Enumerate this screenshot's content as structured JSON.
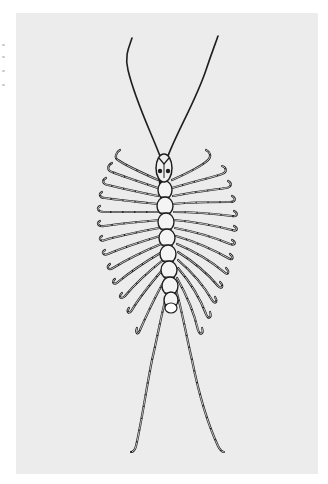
{
  "image": {
    "subject": "House centipede (Scutigera coleoptrata) line illustration",
    "background_color": "#ececec",
    "page_color": "#ffffff",
    "ink_color": "#1e1e1e",
    "segment_fill": "#f4f4f4"
  },
  "centipede": {
    "head": {
      "cx": 164,
      "cy": 168,
      "rx": 8,
      "ry": 14
    },
    "antennae": [
      {
        "side": "left",
        "path": "M160 156 C 150 130, 135 100, 128 70 C 124 55, 130 45, 132 38"
      },
      {
        "side": "right",
        "path": "M168 156 C 178 130, 196 100, 206 70 C 212 52, 216 42, 218 36"
      }
    ],
    "segments": [
      {
        "cx": 165,
        "cy": 190,
        "rx": 7,
        "ry": 9
      },
      {
        "cx": 165,
        "cy": 206,
        "rx": 8,
        "ry": 9
      },
      {
        "cx": 166,
        "cy": 222,
        "rx": 8,
        "ry": 9
      },
      {
        "cx": 167,
        "cy": 238,
        "rx": 8,
        "ry": 9
      },
      {
        "cx": 168,
        "cy": 254,
        "rx": 8,
        "ry": 9
      },
      {
        "cx": 169,
        "cy": 270,
        "rx": 8,
        "ry": 9
      },
      {
        "cx": 170,
        "cy": 286,
        "rx": 8,
        "ry": 9
      },
      {
        "cx": 171,
        "cy": 300,
        "rx": 7,
        "ry": 8
      }
    ],
    "legs_left": [
      "M158 180 C 140 172, 125 165, 118 160 C 114 158, 116 152, 120 150",
      "M158 188 C 140 182, 122 176, 112 172 C 106 170, 108 165, 112 163",
      "M158 196 C 138 192, 120 188, 108 185 C 102 184, 102 180, 106 178",
      "M158 204 C 138 202, 118 200, 105 198 C 100 198, 98 194, 102 192",
      "M158 212 C 138 212, 118 212, 104 212 C 98 212, 96 208, 100 206",
      "M159 220 C 138 222, 118 224, 104 226 C 98 227, 96 223, 100 221",
      "M159 228 C 138 232, 118 236, 105 240 C 100 242, 98 238, 102 236",
      "M160 236 C 140 242, 122 248, 108 254 C 103 256, 101 252, 105 250",
      "M161 244 C 142 252, 126 260, 113 268 C 108 271, 106 267, 110 264",
      "M162 252 C 145 262, 130 272, 118 282 C 114 286, 111 282, 115 279",
      "M163 260 C 148 272, 135 284, 125 296 C 121 300, 118 297, 122 293",
      "M164 268 C 152 282, 140 296, 132 310 C 129 315, 126 312, 129 308",
      "M166 278 C 156 294, 148 312, 140 330 C 138 336, 135 333, 137 328",
      "M168 290 C 162 310, 158 335, 152 360 C 146 390, 142 420, 136 446 C 135 450, 133 452, 131 452"
    ],
    "legs_right": [
      "M172 180 C 190 172, 202 166, 208 160 C 212 156, 210 152, 206 150",
      "M172 188 C 192 182, 210 178, 222 174 C 228 172, 226 167, 222 166",
      "M173 196 C 194 192, 212 190, 226 188 C 232 187, 232 183, 228 181",
      "M173 204 C 194 202, 214 202, 230 202 C 236 202, 236 198, 232 196",
      "M174 212 C 196 212, 216 214, 232 216 C 238 217, 238 213, 234 211",
      "M174 220 C 196 222, 216 226, 232 230 C 238 232, 238 228, 234 226",
      "M175 228 C 196 232, 216 238, 230 244 C 236 246, 236 242, 232 240",
      "M176 236 C 196 242, 214 250, 228 258 C 233 261, 234 257, 230 254",
      "M177 244 C 196 252, 212 262, 224 272 C 228 276, 230 272, 226 268",
      "M178 252 C 194 262, 208 274, 218 286 C 222 290, 224 286, 220 282",
      "M178 260 C 192 272, 204 286, 212 300 C 215 305, 218 302, 215 297",
      "M178 268 C 190 282, 200 298, 206 314 C 208 320, 212 318, 210 312",
      "M177 278 C 186 294, 194 312, 198 330 C 200 336, 204 334, 202 328",
      "M176 290 C 182 310, 186 335, 192 360 C 198 390, 206 420, 218 446 C 220 450, 222 452, 224 452"
    ]
  },
  "margin_marks": [
    0,
    12,
    26,
    40
  ]
}
